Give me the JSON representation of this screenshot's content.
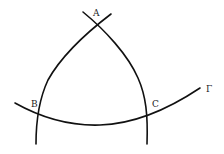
{
  "diagram": {
    "type": "spherical-triangle",
    "labels": {
      "vertex_a": "A",
      "vertex_b": "B",
      "vertex_c": "C",
      "curve": "Γ"
    },
    "colors": {
      "stroke": "#111111",
      "text": "#222222",
      "background": "#ffffff"
    }
  }
}
